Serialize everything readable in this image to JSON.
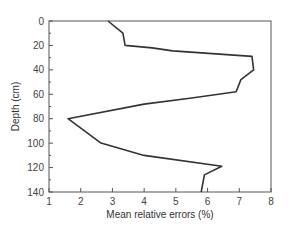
{
  "chart_data": {
    "type": "line",
    "title": "",
    "xlabel": "Mean relative errors (%)",
    "ylabel": "Depth (cm)",
    "xlim": [
      1,
      8
    ],
    "ylim": [
      0,
      140
    ],
    "y_inverted": true,
    "x_ticks": [
      1,
      2,
      3,
      4,
      5,
      6,
      7,
      8
    ],
    "y_ticks": [
      0,
      20,
      40,
      60,
      80,
      100,
      120,
      140
    ],
    "y_minor_step": 10,
    "grid": false,
    "legend": null,
    "series": [
      {
        "name": "Mean relative errors",
        "color": "#333333",
        "points": [
          {
            "x": 2.86,
            "depth": 0
          },
          {
            "x": 3.33,
            "depth": 10
          },
          {
            "x": 3.4,
            "depth": 20
          },
          {
            "x": 4.25,
            "depth": 22
          },
          {
            "x": 4.9,
            "depth": 24.5
          },
          {
            "x": 7.4,
            "depth": 29
          },
          {
            "x": 7.45,
            "depth": 40
          },
          {
            "x": 7.05,
            "depth": 48
          },
          {
            "x": 6.9,
            "depth": 58
          },
          {
            "x": 5.5,
            "depth": 63
          },
          {
            "x": 4.0,
            "depth": 68
          },
          {
            "x": 1.6,
            "depth": 80
          },
          {
            "x": 2.64,
            "depth": 100
          },
          {
            "x": 4.0,
            "depth": 110
          },
          {
            "x": 6.45,
            "depth": 119
          },
          {
            "x": 5.9,
            "depth": 126
          },
          {
            "x": 5.8,
            "depth": 140
          }
        ]
      }
    ]
  },
  "layout": {
    "plot_left": 49,
    "plot_top": 21,
    "plot_width": 222,
    "plot_height": 171,
    "frame_color": "#555555",
    "line_color": "#333333"
  }
}
